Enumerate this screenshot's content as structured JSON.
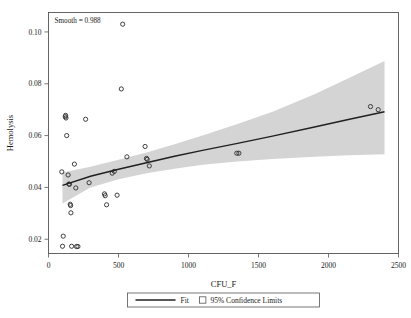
{
  "chart_data": {
    "type": "scatter",
    "title": "",
    "xlabel": "CFU_F",
    "ylabel": "Hemolysis",
    "xlim": [
      0,
      2500
    ],
    "ylim": [
      0.0145,
      0.1075
    ],
    "xticks": [
      0,
      500,
      1000,
      1500,
      2000,
      2500
    ],
    "xtick_labels": [
      "0",
      "500",
      "1000",
      "1500",
      "2000",
      "2500"
    ],
    "yticks": [
      0.02,
      0.04,
      0.06,
      0.08,
      0.1
    ],
    "ytick_labels": [
      "0.02",
      "0.04",
      "0.06",
      "0.08",
      "0.10"
    ],
    "grid": false,
    "annotation": "Smooth = 0.988",
    "legend_position": "bottom-center",
    "marker_style": "open-circle",
    "points": [
      {
        "x": 95,
        "y": 0.046
      },
      {
        "x": 100,
        "y": 0.0173
      },
      {
        "x": 105,
        "y": 0.0212
      },
      {
        "x": 120,
        "y": 0.0673
      },
      {
        "x": 122,
        "y": 0.0678
      },
      {
        "x": 125,
        "y": 0.0668
      },
      {
        "x": 130,
        "y": 0.06
      },
      {
        "x": 140,
        "y": 0.0448
      },
      {
        "x": 145,
        "y": 0.0413
      },
      {
        "x": 150,
        "y": 0.0412
      },
      {
        "x": 155,
        "y": 0.0335
      },
      {
        "x": 158,
        "y": 0.033
      },
      {
        "x": 160,
        "y": 0.0302
      },
      {
        "x": 165,
        "y": 0.0173
      },
      {
        "x": 185,
        "y": 0.049
      },
      {
        "x": 195,
        "y": 0.0398
      },
      {
        "x": 200,
        "y": 0.0172
      },
      {
        "x": 210,
        "y": 0.0172
      },
      {
        "x": 265,
        "y": 0.0663
      },
      {
        "x": 290,
        "y": 0.0418
      },
      {
        "x": 400,
        "y": 0.0375
      },
      {
        "x": 405,
        "y": 0.0368
      },
      {
        "x": 415,
        "y": 0.0333
      },
      {
        "x": 455,
        "y": 0.0455
      },
      {
        "x": 470,
        "y": 0.0462
      },
      {
        "x": 490,
        "y": 0.037
      },
      {
        "x": 520,
        "y": 0.078
      },
      {
        "x": 530,
        "y": 0.103
      },
      {
        "x": 560,
        "y": 0.0518
      },
      {
        "x": 690,
        "y": 0.0558
      },
      {
        "x": 700,
        "y": 0.0512
      },
      {
        "x": 705,
        "y": 0.0508
      },
      {
        "x": 720,
        "y": 0.0483
      },
      {
        "x": 1345,
        "y": 0.0532
      },
      {
        "x": 1360,
        "y": 0.0532
      },
      {
        "x": 2300,
        "y": 0.0712
      },
      {
        "x": 2355,
        "y": 0.07
      }
    ],
    "fit_line": [
      {
        "x": 100,
        "y": 0.0408
      },
      {
        "x": 300,
        "y": 0.0443
      },
      {
        "x": 500,
        "y": 0.047
      },
      {
        "x": 700,
        "y": 0.0495
      },
      {
        "x": 900,
        "y": 0.052
      },
      {
        "x": 1100,
        "y": 0.0543
      },
      {
        "x": 1350,
        "y": 0.057
      },
      {
        "x": 1600,
        "y": 0.0598
      },
      {
        "x": 1900,
        "y": 0.0633
      },
      {
        "x": 2150,
        "y": 0.0663
      },
      {
        "x": 2400,
        "y": 0.0692
      }
    ],
    "confidence_band_upper": [
      {
        "x": 100,
        "y": 0.0458
      },
      {
        "x": 300,
        "y": 0.048
      },
      {
        "x": 500,
        "y": 0.0507
      },
      {
        "x": 700,
        "y": 0.0535
      },
      {
        "x": 900,
        "y": 0.0567
      },
      {
        "x": 1100,
        "y": 0.06
      },
      {
        "x": 1350,
        "y": 0.0645
      },
      {
        "x": 1600,
        "y": 0.0692
      },
      {
        "x": 1900,
        "y": 0.076
      },
      {
        "x": 2150,
        "y": 0.0823
      },
      {
        "x": 2400,
        "y": 0.0888
      }
    ],
    "confidence_band_lower": [
      {
        "x": 100,
        "y": 0.0338
      },
      {
        "x": 300,
        "y": 0.04
      },
      {
        "x": 500,
        "y": 0.0432
      },
      {
        "x": 700,
        "y": 0.0455
      },
      {
        "x": 900,
        "y": 0.0472
      },
      {
        "x": 1100,
        "y": 0.0487
      },
      {
        "x": 1350,
        "y": 0.05
      },
      {
        "x": 1600,
        "y": 0.051
      },
      {
        "x": 1900,
        "y": 0.0518
      },
      {
        "x": 2150,
        "y": 0.0524
      },
      {
        "x": 2400,
        "y": 0.0528
      }
    ],
    "band_color": "#d4d4d4",
    "fit_color": "#202020",
    "marker_color": "#2b2b2b",
    "legend": [
      {
        "key": "fit",
        "label": "Fit",
        "type": "line"
      },
      {
        "key": "ci",
        "label": "95% Confidence Limits",
        "type": "swatch"
      }
    ]
  }
}
